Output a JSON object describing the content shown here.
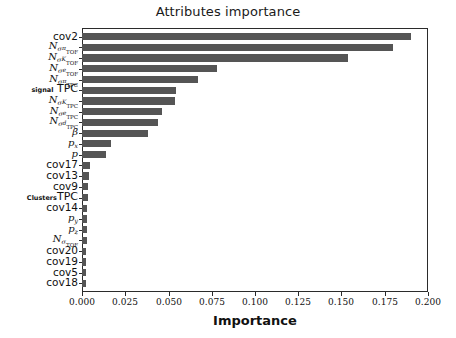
{
  "chart_data": {
    "type": "bar",
    "orientation": "horizontal",
    "title": "Attributes importance",
    "xlabel": "Importance",
    "ylabel": "",
    "xlim": [
      0.0,
      0.2
    ],
    "xticks": [
      0.0,
      0.025,
      0.05,
      0.075,
      0.1,
      0.125,
      0.15,
      0.175,
      0.2
    ],
    "xtick_labels": [
      "0.000",
      "0.025",
      "0.050",
      "0.075",
      "0.100",
      "0.125",
      "0.150",
      "0.175",
      "0.200"
    ],
    "grid": false,
    "legend": null,
    "bar_color": "#555555",
    "categories": [
      "cov2",
      "N_sigma_pi_TOF",
      "N_sigma_K_TOF",
      "N_sigma_e_TOF",
      "N_sigma_pi_TPC",
      "signal TPC",
      "N_sigma_K_TPC",
      "N_sigma_e_TPC",
      "N_sigma_d_TPC",
      "beta",
      "p_x",
      "p",
      "cov17",
      "cov13",
      "cov9",
      "Clusters TPC",
      "cov14",
      "p_y",
      "p_z",
      "N_sigma_d_TOF",
      "cov20",
      "cov19",
      "cov5",
      "cov18"
    ],
    "values": [
      0.19,
      0.18,
      0.154,
      0.078,
      0.067,
      0.0545,
      0.054,
      0.046,
      0.044,
      0.038,
      0.017,
      0.014,
      0.0045,
      0.004,
      0.0035,
      0.0032,
      0.003,
      0.0028,
      0.0028,
      0.0027,
      0.0025,
      0.0025,
      0.0023,
      0.0022
    ],
    "tick_label_html": [
      "cov2",
      "N_{\\sigma^{\\pi}_{TOF}}",
      "N_{\\sigma^{K}_{TOF}}",
      "N_{\\sigma^{e}_{TOF}}",
      "N_{\\sigma^{\\pi}_{TPC}}",
      "signal TPC",
      "N_{\\sigma^{K}_{TPC}}",
      "N_{\\sigma^{e}_{TPC}}",
      "N_{\\sigma^{d}_{TPC}}",
      "\\beta",
      "p_x",
      "p",
      "cov17",
      "cov13",
      "cov9",
      "Clusters TPC",
      "cov14",
      "p_y",
      "p_z",
      "N_{\\sigma_{TOF}}",
      "cov20",
      "cov19",
      "cov5",
      "cov18"
    ]
  }
}
